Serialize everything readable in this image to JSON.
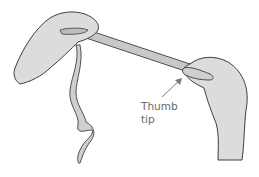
{
  "illustration": {
    "subject": "two hands stretching a ribbon",
    "annotation": {
      "line1": "Thumb",
      "line2": "tip"
    },
    "colors": {
      "skin_fill": "#dcdcdc",
      "outline": "#2a2a2a",
      "ribbon_fill": "#c8c8c8",
      "label_color": "#6a6a6a",
      "arrow_color": "#7a7a7a"
    }
  }
}
